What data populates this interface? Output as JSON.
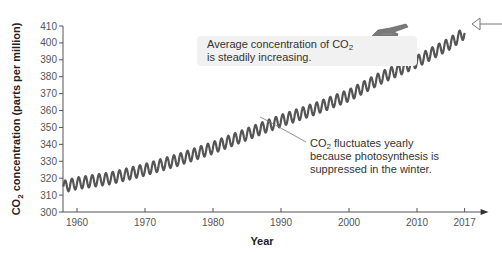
{
  "chart_data": {
    "type": "line",
    "title": "",
    "xlabel": "Year",
    "ylabel": "CO2 concentration (parts per million)",
    "ylim": [
      300,
      410
    ],
    "xlim": [
      1958,
      2017
    ],
    "grid": false,
    "legend": null,
    "x_ticks": [
      1960,
      1970,
      1980,
      1990,
      2000,
      2010,
      2017
    ],
    "y_ticks": [
      300,
      310,
      320,
      330,
      340,
      350,
      360,
      370,
      380,
      390,
      400,
      410
    ],
    "series": [
      {
        "name": "Monthly CO2 concentration (seasonal oscillation)",
        "color": "#555555",
        "x": [
          1958,
          1960,
          1965,
          1970,
          1975,
          1980,
          1985,
          1990,
          1995,
          2000,
          2005,
          2010,
          2015,
          2017
        ],
        "trend_values": [
          315,
          317,
          320,
          325,
          331,
          338,
          346,
          354,
          361,
          369,
          380,
          389,
          400,
          406
        ],
        "seasonal_amplitude": 3.5
      }
    ],
    "annotations": [
      {
        "text_parts": [
          "Average concentration of CO",
          "2",
          "",
          "is steadily increasing."
        ],
        "pointer": "hand-pointing-icon"
      },
      {
        "text_parts": [
          "CO",
          "2",
          " fluctuates yearly",
          "because photosynthesis is",
          "suppressed in the winter."
        ]
      }
    ]
  },
  "labels": {
    "ylabel_pre": "CO",
    "ylabel_sub": "2",
    "ylabel_post": " concentration (parts per million)",
    "xlabel": "Year",
    "avg_line1_pre": "Average concentration of CO",
    "avg_line1_sub": "2",
    "avg_line2": "is steadily increasing.",
    "fluct_line1_pre": "CO",
    "fluct_line1_sub": "2",
    "fluct_line1_post": " fluctuates yearly",
    "fluct_line2": "because photosynthesis is",
    "fluct_line3": "suppressed in the winter."
  }
}
